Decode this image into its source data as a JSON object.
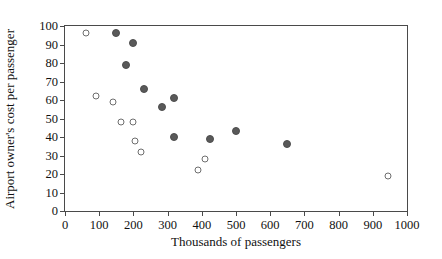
{
  "chart_data": {
    "type": "scatter",
    "title": "",
    "xlabel": "Thousands of passengers",
    "ylabel": "Airport owner's cost per passenger",
    "xlim": [
      0,
      1000
    ],
    "ylim": [
      0,
      100
    ],
    "xticks": [
      0,
      100,
      200,
      300,
      400,
      500,
      600,
      700,
      800,
      900,
      1000
    ],
    "yticks": [
      0,
      10,
      20,
      30,
      40,
      50,
      60,
      70,
      80,
      90,
      100
    ],
    "grid": false,
    "legend": "none",
    "series": [
      {
        "name": "filled",
        "marker": "filled-circle",
        "color": "#595959",
        "points": [
          {
            "x": 150,
            "y": 96
          },
          {
            "x": 200,
            "y": 91
          },
          {
            "x": 178,
            "y": 79
          },
          {
            "x": 230,
            "y": 66
          },
          {
            "x": 318,
            "y": 61
          },
          {
            "x": 285,
            "y": 56
          },
          {
            "x": 500,
            "y": 43
          },
          {
            "x": 318,
            "y": 40
          },
          {
            "x": 425,
            "y": 39
          },
          {
            "x": 650,
            "y": 36
          }
        ]
      },
      {
        "name": "open",
        "marker": "open-circle",
        "color": "#6e6e6e",
        "points": [
          {
            "x": 60,
            "y": 96
          },
          {
            "x": 92,
            "y": 62
          },
          {
            "x": 140,
            "y": 59
          },
          {
            "x": 163,
            "y": 48
          },
          {
            "x": 198,
            "y": 48
          },
          {
            "x": 205,
            "y": 38
          },
          {
            "x": 222,
            "y": 32
          },
          {
            "x": 408,
            "y": 28
          },
          {
            "x": 390,
            "y": 22
          },
          {
            "x": 945,
            "y": 19
          }
        ]
      }
    ]
  }
}
